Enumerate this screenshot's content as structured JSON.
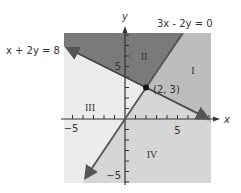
{
  "figure": {
    "type": "diagram",
    "axes": {
      "x_label": "x",
      "y_label": "y",
      "x_ticks": {
        "labeled": [
          {
            "value": -5,
            "label": "−5"
          },
          {
            "value": 5,
            "label": "5"
          }
        ]
      },
      "y_ticks": {
        "labeled": [
          {
            "value": 5,
            "label": "5"
          },
          {
            "value": -5,
            "label": "−5"
          }
        ]
      },
      "range": {
        "x": [
          -6,
          8
        ],
        "y": [
          -6,
          8
        ]
      }
    },
    "lines": [
      {
        "id": "line1",
        "equation": "x + 2y = 8",
        "label": "x + 2y = 8",
        "color": "#555555"
      },
      {
        "id": "line2",
        "equation": "3x - 2y = 0",
        "label": "3x - 2y = 0",
        "color": "#666666"
      }
    ],
    "intersection": {
      "label": "(2, 3)",
      "x": 2,
      "y": 3
    },
    "regions": [
      {
        "id": "I",
        "label": "I",
        "fill": "#bdbdbd"
      },
      {
        "id": "II",
        "label": "II",
        "fill": "#7a7a7a"
      },
      {
        "id": "III",
        "label": "III",
        "fill": "#ececec"
      },
      {
        "id": "IV",
        "label": "IV",
        "fill": "#d6d6d6"
      }
    ]
  }
}
